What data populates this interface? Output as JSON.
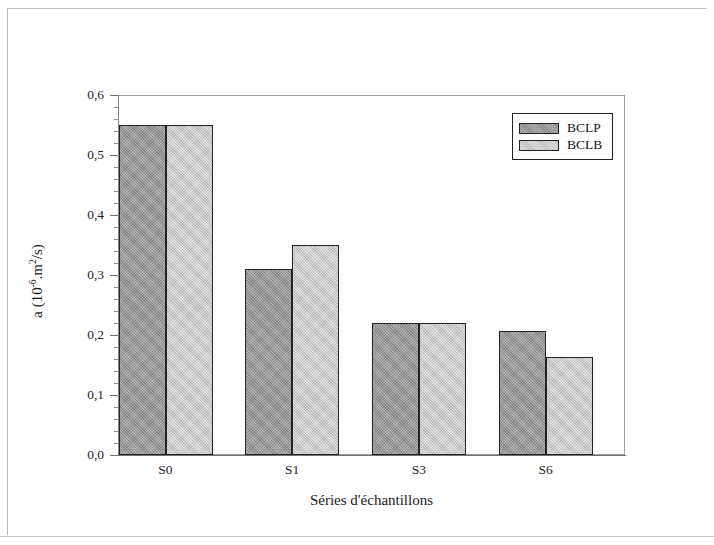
{
  "chart_data": {
    "type": "bar",
    "title": "",
    "xlabel": "Séries d'échantillons",
    "ylabel": "a (10-6.m2/s)",
    "ylabel_parts": {
      "prefix": "a (10",
      "exp1": "-6",
      "mid": ".m",
      "exp2": "2",
      "suffix": "/s)"
    },
    "categories": [
      "S0",
      "S1",
      "S3",
      "S6"
    ],
    "series": [
      {
        "name": "BCLP",
        "color": "#9b9b9b",
        "values": [
          0.55,
          0.31,
          0.22,
          0.207
        ]
      },
      {
        "name": "BCLB",
        "color": "#cfcfcf",
        "values": [
          0.55,
          0.35,
          0.22,
          0.163
        ]
      }
    ],
    "ylim": [
      0.0,
      0.6
    ],
    "ytick_labels": [
      "0,0",
      "0,1",
      "0,2",
      "0,3",
      "0,4",
      "0,5",
      "0,6"
    ],
    "ytick_values": [
      0.0,
      0.1,
      0.2,
      0.3,
      0.4,
      0.5,
      0.6
    ],
    "minor_ticks_per_interval": 5,
    "grid": false,
    "legend_position": "top-right",
    "legend_entries": [
      "BCLP",
      "BCLB"
    ]
  }
}
